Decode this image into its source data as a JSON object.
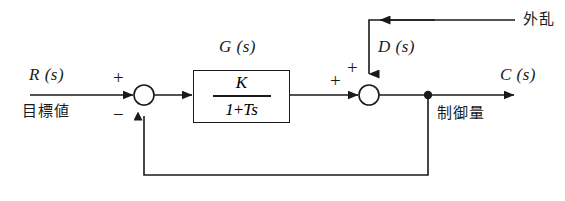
{
  "diagram": {
    "type": "control-system-block-diagram",
    "line_color": "#1a1a1a",
    "background": "#ffffff"
  },
  "signals": {
    "reference": {
      "symbol": "R (s)",
      "name_jp": "目標値"
    },
    "output": {
      "symbol": "C (s)",
      "name_jp": "制御量"
    },
    "disturbance": {
      "symbol": "D (s)",
      "name_jp": "外乱"
    }
  },
  "plant": {
    "label": "G (s)",
    "numerator": "K",
    "denominator_terms": [
      "1",
      "+",
      "Ts"
    ],
    "denominator": "1 + Ts",
    "transfer_function": "K / (1 + Ts)"
  },
  "summing_junctions": [
    {
      "id": "sum-1",
      "inputs": [
        {
          "source": "reference",
          "sign": "+"
        },
        {
          "source": "feedback",
          "sign": "−"
        }
      ]
    },
    {
      "id": "sum-2",
      "inputs": [
        {
          "source": "plant-output",
          "sign": "+"
        },
        {
          "source": "disturbance",
          "sign": "+"
        }
      ]
    }
  ],
  "signs": {
    "plus": "+",
    "minus": "−"
  }
}
